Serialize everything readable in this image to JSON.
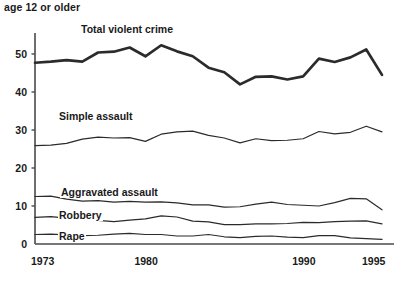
{
  "header": {
    "note": "age 12 or older"
  },
  "axes": {
    "y_ticks": [
      {
        "label": "50",
        "value": 50
      },
      {
        "label": "40",
        "value": 40
      },
      {
        "label": "30",
        "value": 30
      },
      {
        "label": "20",
        "value": 20
      },
      {
        "label": "10",
        "value": 10
      },
      {
        "label": "0",
        "value": 0
      }
    ],
    "x_ticks": [
      {
        "label": "1973",
        "value": 1973
      },
      {
        "label": "1980",
        "value": 1980
      },
      {
        "label": "1990",
        "value": 1990
      },
      {
        "label": "1995",
        "value": 1995
      }
    ]
  },
  "series_labels": {
    "total": "Total violent crime",
    "simple": "Simple assault",
    "aggravated": "Aggravated assault",
    "robbery": "Robbery",
    "rape": "Rape"
  },
  "colors": {
    "line": "#2b2b2b",
    "axis": "#4a4a4a",
    "text": "#1a1a1a",
    "background": "#ffffff"
  },
  "chart_data": {
    "type": "line",
    "title": "",
    "subtitle": "age 12 or older",
    "xlabel": "",
    "ylabel": "",
    "xlim": [
      1973,
      1995
    ],
    "ylim": [
      0,
      55
    ],
    "grid": false,
    "legend": "inline-labels",
    "x": [
      1973,
      1974,
      1975,
      1976,
      1977,
      1978,
      1979,
      1980,
      1981,
      1982,
      1983,
      1984,
      1985,
      1986,
      1987,
      1988,
      1989,
      1990,
      1991,
      1992,
      1993,
      1994,
      1995
    ],
    "series": [
      {
        "name": "Total violent crime",
        "emphasis": "thick",
        "values": [
          47.7,
          48.0,
          48.4,
          48.0,
          50.4,
          50.6,
          51.7,
          49.4,
          52.3,
          50.7,
          49.4,
          46.4,
          45.2,
          42.0,
          44.0,
          44.1,
          43.3,
          44.1,
          48.8,
          47.9,
          49.1,
          51.2,
          44.5
        ]
      },
      {
        "name": "Simple assault",
        "emphasis": "thin",
        "values": [
          25.9,
          26.0,
          26.5,
          27.6,
          28.1,
          27.9,
          28.0,
          27.0,
          28.9,
          29.5,
          29.7,
          28.6,
          27.9,
          26.6,
          27.7,
          27.2,
          27.3,
          27.7,
          29.6,
          29.0,
          29.4,
          31.0,
          29.5
        ]
      },
      {
        "name": "Aggravated assault",
        "emphasis": "thin",
        "values": [
          12.5,
          12.6,
          11.8,
          11.3,
          11.4,
          11.0,
          11.2,
          11.0,
          11.1,
          10.8,
          10.3,
          10.3,
          9.7,
          9.8,
          10.5,
          11.0,
          10.4,
          10.2,
          10.0,
          10.9,
          12.0,
          11.9,
          9.0
        ]
      },
      {
        "name": "Robbery",
        "emphasis": "thin",
        "values": [
          7.0,
          7.2,
          6.8,
          6.5,
          6.2,
          5.9,
          6.3,
          6.6,
          7.4,
          7.1,
          6.0,
          5.8,
          5.1,
          5.1,
          5.3,
          5.3,
          5.4,
          5.7,
          5.6,
          5.9,
          6.0,
          6.1,
          5.3
        ]
      },
      {
        "name": "Rape",
        "emphasis": "thin",
        "values": [
          2.5,
          2.6,
          2.4,
          2.2,
          2.3,
          2.6,
          2.8,
          2.5,
          2.5,
          2.1,
          2.1,
          2.5,
          1.9,
          1.7,
          2.0,
          2.1,
          1.8,
          1.7,
          2.2,
          2.2,
          1.6,
          1.4,
          1.2
        ]
      }
    ]
  }
}
